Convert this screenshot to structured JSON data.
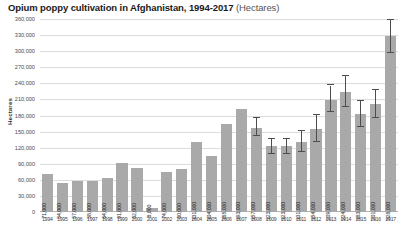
{
  "chart_data": {
    "type": "bar",
    "title": "Opium poppy cultivation in Afghanistan, 1994-2017",
    "title_units": "(Hectares)",
    "xlabel": "",
    "ylabel": "Hectares",
    "ylim": [
      0,
      360000
    ],
    "ytick_step": 30000,
    "grid": true,
    "legend": "none",
    "bar_color": "#a9a9a9",
    "gridline_color": "#dcdcdc",
    "error_bar_color": "#4d4d4d",
    "ytick_labels": [
      "360,000",
      "330,000",
      "300,000",
      "270,000",
      "240,000",
      "210,000",
      "180,000",
      "150,000",
      "120,000",
      "90,000",
      "60,000",
      "30,000",
      "0"
    ],
    "ytick_values": [
      360000,
      330000,
      300000,
      270000,
      240000,
      210000,
      180000,
      150000,
      120000,
      90000,
      60000,
      30000,
      0
    ],
    "categories": [
      "1994",
      "1995",
      "1996",
      "1997",
      "1998",
      "1999",
      "2000",
      "2001",
      "2002",
      "2003",
      "2004",
      "2005",
      "2006",
      "2007",
      "2008",
      "2009",
      "2010",
      "2011",
      "2012",
      "2013",
      "2014",
      "2015",
      "2016",
      "2017"
    ],
    "values": [
      71000,
      54000,
      57000,
      58000,
      64000,
      91000,
      82000,
      8000,
      74000,
      80000,
      131000,
      104000,
      165000,
      193000,
      157000,
      123000,
      123000,
      131000,
      154000,
      209000,
      224000,
      183000,
      201000,
      328000
    ],
    "value_labels": [
      "71,000",
      "54,000",
      "57,000",
      "58,000",
      "64,000",
      "91,000",
      "82,000",
      "8,000",
      "74,000",
      "80,000",
      "131,000",
      "104,000",
      "165,000",
      "193,000",
      "157,000",
      "123,000",
      "123,000",
      "131,000",
      "154,000",
      "209,000",
      "224,000",
      "183,000",
      "201,000",
      "328,000"
    ],
    "error_bars": [
      null,
      null,
      null,
      null,
      null,
      null,
      null,
      null,
      null,
      null,
      null,
      null,
      null,
      null,
      {
        "low": 141000,
        "high": 175000
      },
      {
        "low": 108000,
        "high": 137000
      },
      {
        "low": 108000,
        "high": 137000
      },
      {
        "low": 112000,
        "high": 151000
      },
      {
        "low": 130000,
        "high": 181000
      },
      {
        "low": 186000,
        "high": 236000
      },
      {
        "low": 196000,
        "high": 253000
      },
      {
        "low": 159000,
        "high": 208000
      },
      {
        "low": 175000,
        "high": 228000
      },
      {
        "low": 296000,
        "high": 358000
      }
    ]
  }
}
